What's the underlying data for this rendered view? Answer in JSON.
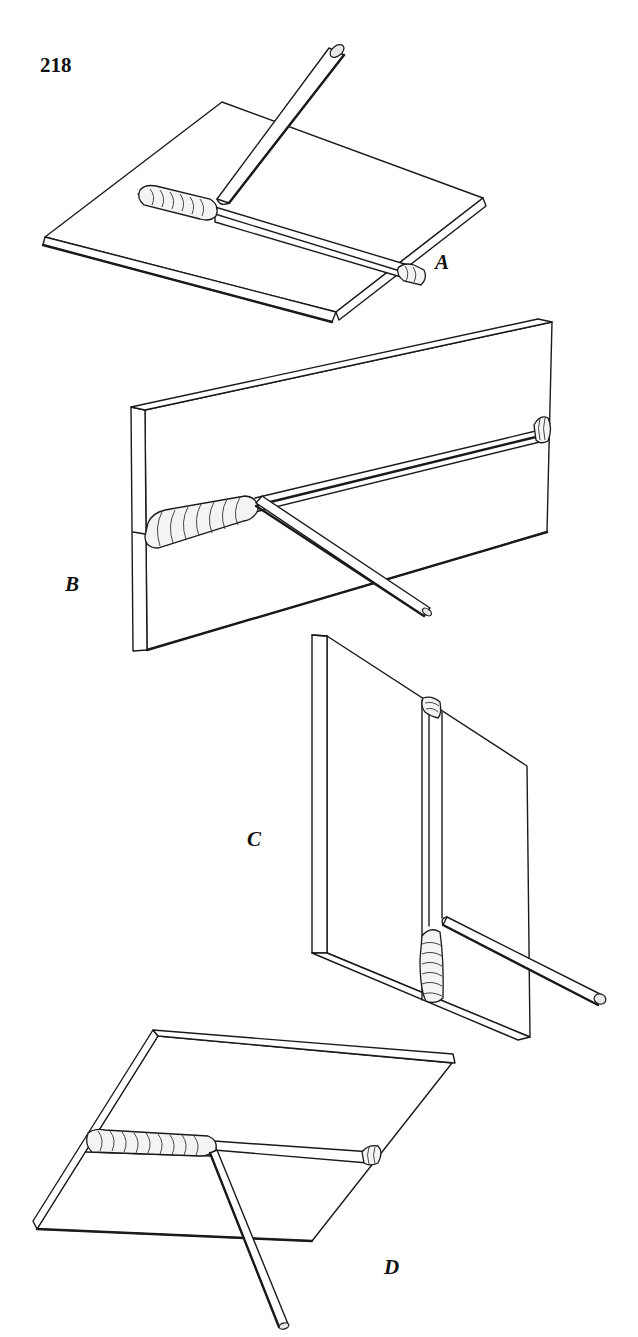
{
  "page": {
    "page_number": "218",
    "background": "#ffffff",
    "ink_color": "#1a1a1a"
  },
  "figures": [
    {
      "id": "A",
      "label": "A",
      "position": "flat",
      "description": "Flat plate with horizontal bead, electrode held from above"
    },
    {
      "id": "B",
      "label": "B",
      "position": "horizontal",
      "description": "Vertical plate with horizontal bead, electrode angled downward"
    },
    {
      "id": "C",
      "label": "C",
      "position": "vertical",
      "description": "Vertical plate with vertical bead, electrode from the side"
    },
    {
      "id": "D",
      "label": "D",
      "position": "overhead",
      "description": "Overhead plate with bead on underside, electrode pointing up"
    }
  ]
}
